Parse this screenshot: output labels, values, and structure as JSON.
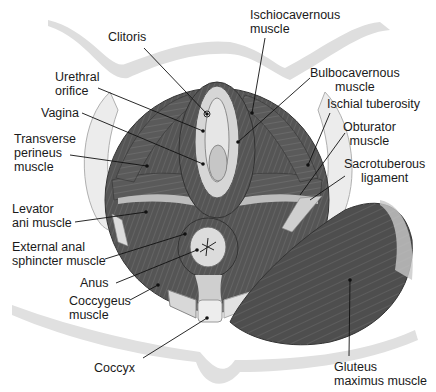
{
  "figure": {
    "colors": {
      "muscle_dark": "#4a4a4a",
      "muscle_mid": "#666666",
      "muscle_light": "#8a8a8a",
      "bone": "#e8e8e8",
      "skin_outline": "#dcdcdc",
      "leader_line": "#111111",
      "text": "#1a1a1a"
    }
  },
  "labels": {
    "clitoris": "Clitoris",
    "urethral_orifice": "Urethral\norifice",
    "vagina": "Vagina",
    "transverse_perineus": "Transverse\nperineus\nmuscle",
    "levator_ani": "Levator\nani muscle",
    "external_anal_sphincter": "External anal\nsphincter muscle",
    "anus": "Anus",
    "coccygeus": "Coccygeus\nmuscle",
    "coccyx": "Coccyx",
    "ischiocavernous": "Ischiocavernous\nmuscle",
    "bulbocavernous": "Bulbocavernous\nmuscle",
    "ischial_tuberosity": "Ischial tuberosity",
    "obturator": "Obturator\nmuscle",
    "sacrotuberous": "Sacrotuberous\nligament",
    "gluteus_maximus": "Gluteus\nmaximus muscle"
  }
}
